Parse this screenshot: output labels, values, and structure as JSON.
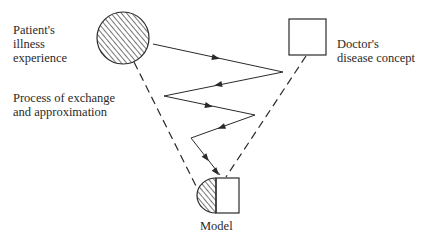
{
  "labels": {
    "patient": [
      "Patient's",
      "illness",
      "experience"
    ],
    "process": [
      "Process of exchange",
      "and approximation"
    ],
    "doctor": [
      "Doctor's",
      "disease concept"
    ],
    "model": "Model"
  },
  "nodes": {
    "patient_circle": {
      "shape": "circle",
      "fill": "hatched",
      "cx": 123,
      "cy": 38,
      "r": 26
    },
    "doctor_square": {
      "shape": "square",
      "fill": "none",
      "x": 289,
      "y": 19,
      "w": 37,
      "h": 36
    },
    "model_shape": {
      "shape": "half-hatched-semicircle + square",
      "x": 197,
      "y": 178,
      "w": 42,
      "h": 35
    }
  },
  "edges": {
    "dashed": [
      {
        "from": "patient_circle",
        "to": "model_shape"
      },
      {
        "from": "doctor_square",
        "to": "model_shape"
      }
    ],
    "zigzag_points": [
      [
        153,
        44
      ],
      [
        283,
        72
      ],
      [
        164,
        96
      ],
      [
        255,
        115
      ],
      [
        191,
        138
      ],
      [
        220,
        175
      ]
    ]
  },
  "colors": {
    "stroke": "#2a2a2a",
    "background": "#ffffff"
  }
}
